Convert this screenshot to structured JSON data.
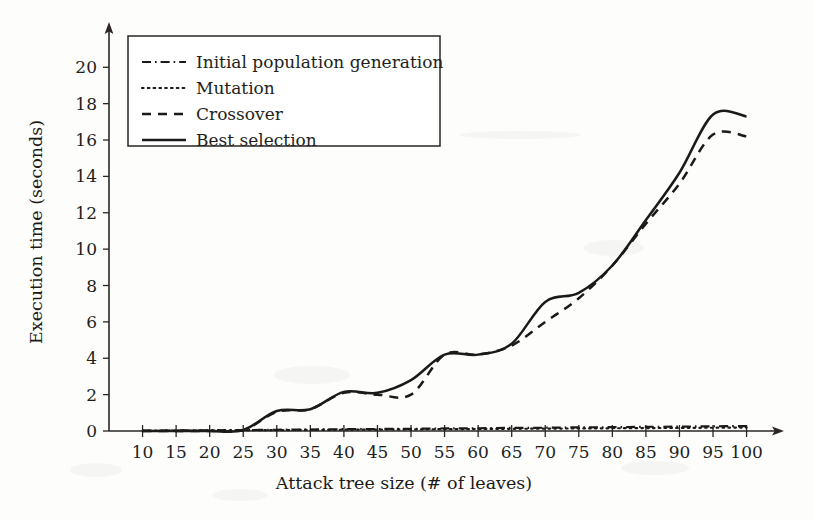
{
  "chart_data": {
    "type": "line",
    "title": "",
    "xlabel": "Attack tree size (# of leaves)",
    "ylabel": "Execution time (seconds)",
    "xlim": [
      5,
      102
    ],
    "ylim": [
      0,
      21.5
    ],
    "grid": false,
    "legend_position": "upper-left-inside",
    "x_ticks": [
      10,
      15,
      20,
      25,
      30,
      35,
      40,
      45,
      50,
      55,
      60,
      65,
      70,
      75,
      80,
      85,
      90,
      95,
      100
    ],
    "y_ticks": [
      0,
      2,
      4,
      6,
      8,
      10,
      12,
      14,
      16,
      18,
      20
    ],
    "x": [
      10,
      15,
      20,
      25,
      30,
      35,
      40,
      45,
      50,
      55,
      60,
      65,
      70,
      75,
      80,
      85,
      90,
      95,
      100
    ],
    "series": [
      {
        "name": "Initial population generation",
        "style": "dashdot",
        "values": [
          0.02,
          0.03,
          0.04,
          0.05,
          0.07,
          0.08,
          0.1,
          0.11,
          0.12,
          0.14,
          0.15,
          0.17,
          0.18,
          0.2,
          0.21,
          0.23,
          0.24,
          0.26,
          0.27
        ]
      },
      {
        "name": "Mutation",
        "style": "dotted",
        "values": [
          0.01,
          0.02,
          0.03,
          0.04,
          0.05,
          0.06,
          0.07,
          0.08,
          0.09,
          0.1,
          0.11,
          0.12,
          0.13,
          0.14,
          0.15,
          0.16,
          0.17,
          0.18,
          0.19
        ]
      },
      {
        "name": "Crossover",
        "style": "dashed",
        "values": [
          0.0,
          0.0,
          0.0,
          0.05,
          1.05,
          1.2,
          2.1,
          2.0,
          2.0,
          4.2,
          4.2,
          4.7,
          6.0,
          7.3,
          9.1,
          11.4,
          13.6,
          16.3,
          16.2
        ]
      },
      {
        "name": "Best selection",
        "style": "solid",
        "values": [
          0.0,
          0.0,
          0.0,
          0.05,
          1.1,
          1.2,
          2.15,
          2.1,
          2.8,
          4.2,
          4.2,
          4.8,
          7.1,
          7.6,
          9.1,
          11.6,
          14.2,
          17.4,
          17.3
        ]
      }
    ],
    "legend": [
      {
        "label": "Initial population generation",
        "style": "dashdot"
      },
      {
        "label": "Mutation",
        "style": "dotted"
      },
      {
        "label": "Crossover",
        "style": "dashed"
      },
      {
        "label": "Best selection",
        "style": "solid"
      }
    ],
    "colors": {
      "ink": "#1c1a18",
      "background": "#fdfdfc"
    }
  }
}
